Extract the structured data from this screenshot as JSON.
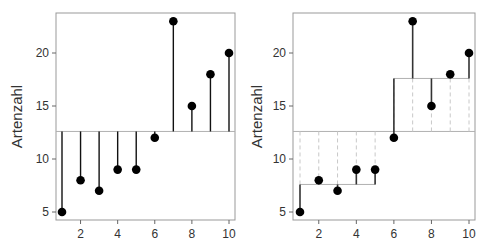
{
  "chart_data": [
    {
      "type": "scatter",
      "subtype": "lollipop-residuals-to-grand-mean",
      "title": "",
      "xlabel": "",
      "ylabel": "Artenzahl",
      "x": [
        1,
        2,
        3,
        4,
        5,
        6,
        7,
        8,
        9,
        10
      ],
      "values": [
        5,
        8,
        7,
        9,
        9,
        12,
        23,
        15,
        18,
        20
      ],
      "grand_mean": 12.6,
      "xlim": [
        0.6,
        10.4
      ],
      "ylim": [
        4.3,
        24.1
      ],
      "xticks": [
        2,
        4,
        6,
        8,
        10
      ],
      "yticks": [
        5,
        10,
        15,
        20
      ],
      "grid": false,
      "legend": null
    },
    {
      "type": "scatter",
      "subtype": "lollipop-residuals-to-group-means",
      "title": "",
      "xlabel": "",
      "ylabel": "Artenzahl",
      "x": [
        1,
        2,
        3,
        4,
        5,
        6,
        7,
        8,
        9,
        10
      ],
      "values": [
        5,
        8,
        7,
        9,
        9,
        12,
        23,
        15,
        18,
        20
      ],
      "grand_mean": 12.6,
      "groups": [
        {
          "name": "Gruppe 1",
          "x": [
            1,
            2,
            3,
            4,
            5
          ],
          "mean": 7.6
        },
        {
          "name": "Gruppe 2",
          "x": [
            6,
            7,
            8,
            9,
            10
          ],
          "mean": 17.6
        }
      ],
      "xlim": [
        0.6,
        10.4
      ],
      "ylim": [
        4.3,
        24.1
      ],
      "xticks": [
        2,
        4,
        6,
        8,
        10
      ],
      "yticks": [
        5,
        10,
        15,
        20
      ],
      "grid": false,
      "legend": null
    }
  ],
  "colors": {
    "points": "#000000",
    "stems_left": "#111111",
    "stems_right": "#333333",
    "mean_line": "#b0b0b0",
    "dashed": "#c8c8c8",
    "frame": "#999999"
  }
}
